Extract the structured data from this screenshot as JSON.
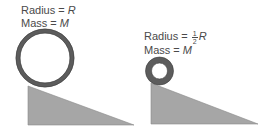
{
  "left_scenario": {
    "radius_label": "Radius = ",
    "radius_var": "R",
    "mass_label": "Mass = ",
    "mass_var": "M"
  },
  "right_scenario": {
    "radius_label": "Radius = ",
    "radius_frac_num": "1",
    "radius_frac_den": "2",
    "radius_var": "R",
    "mass_label": "Mass = ",
    "mass_var": "M"
  },
  "colors": {
    "ring": "#5a5a5a",
    "ramp": "#a6a6a6",
    "text": "#4a4a4a"
  }
}
